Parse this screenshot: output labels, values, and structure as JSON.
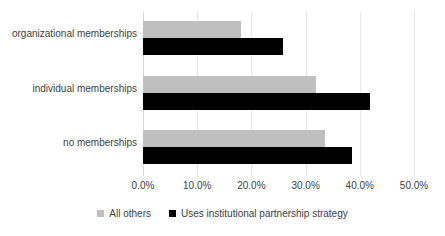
{
  "chart_data": {
    "type": "bar",
    "orientation": "horizontal",
    "title": "",
    "xlabel": "",
    "ylabel": "",
    "categories": [
      "no memberships",
      "individual memberships",
      "organizational memberships"
    ],
    "series": [
      {
        "name": "All others",
        "color": "#bfbfbf",
        "values": [
          33.5,
          31.9,
          18.1
        ]
      },
      {
        "name": "Uses institutional partnership strategy",
        "color": "#000000",
        "values": [
          38.6,
          41.9,
          25.9
        ]
      }
    ],
    "xlim": [
      0,
      50
    ],
    "xticks": [
      0,
      10,
      20,
      30,
      40,
      50
    ],
    "xticklabels": [
      "0.0%",
      "10.0%",
      "20.0%",
      "30.0%",
      "40.0%",
      "50.0%"
    ],
    "grid": "vertical",
    "legend_position": "bottom"
  },
  "axis": {
    "ticks": [
      {
        "label": "0.0%",
        "value": 0
      },
      {
        "label": "10.0%",
        "value": 10
      },
      {
        "label": "20.0%",
        "value": 20
      },
      {
        "label": "30.0%",
        "value": 30
      },
      {
        "label": "40.0%",
        "value": 40
      },
      {
        "label": "50.0%",
        "value": 50
      }
    ]
  },
  "rows": [
    {
      "category": "organizational memberships",
      "others": 18.1,
      "uses": 25.9
    },
    {
      "category": "individual memberships",
      "others": 31.9,
      "uses": 41.9
    },
    {
      "category": "no memberships",
      "others": 33.5,
      "uses": 38.6
    }
  ],
  "legend": {
    "items": [
      {
        "label": "All others",
        "color": "#bfbfbf"
      },
      {
        "label": "Uses institutional partnership strategy",
        "color": "#000000"
      }
    ]
  }
}
